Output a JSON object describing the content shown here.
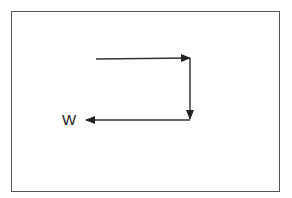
{
  "diagram": {
    "type": "vector-path",
    "frame": {
      "x": 11,
      "y": 11,
      "width": 267,
      "height": 179,
      "stroke": "#555555"
    },
    "stroke_color": "#222222",
    "arrows": [
      {
        "id": "arrow-right",
        "from": [
          96,
          59
        ],
        "to": [
          190,
          58
        ],
        "direction": "right"
      },
      {
        "id": "arrow-down",
        "from": [
          190,
          58
        ],
        "to": [
          190,
          119
        ],
        "direction": "down"
      },
      {
        "id": "arrow-left",
        "from": [
          190,
          120
        ],
        "to": [
          86,
          120
        ],
        "direction": "left"
      }
    ],
    "labels": [
      {
        "id": "resultant-label",
        "text": "W",
        "x": 62,
        "y": 112
      }
    ]
  }
}
